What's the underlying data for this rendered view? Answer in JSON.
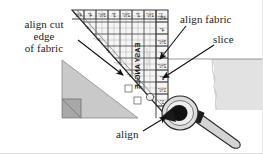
{
  "figure": {
    "background_color": "#ffffff"
  },
  "annotations": [
    {
      "id": "align-cut-edge",
      "text_lines": [
        "align cut",
        "edge",
        "of fabric"
      ],
      "line1": "align cut",
      "line2": "edge",
      "line3": "of fabric",
      "arrow_from": [
        78,
        40
      ],
      "arrow_to": [
        124,
        76
      ]
    },
    {
      "id": "align-fabric",
      "text": "align fabric",
      "arrow_from": [
        186,
        26
      ],
      "arrow_to": [
        159,
        60
      ]
    },
    {
      "id": "slice",
      "text": "slice",
      "arrow_from": [
        214,
        45
      ],
      "arrow_to": [
        162,
        79
      ]
    },
    {
      "id": "align-bottom",
      "text": "align",
      "arrow_from": [
        142,
        131
      ],
      "arrow_to": [
        167,
        116
      ]
    }
  ],
  "ruler": {
    "brand_label": "EASY ANGLE",
    "top_scale": [
      "4½\"",
      "4\"",
      "3½\"",
      "3\"",
      "2½\"",
      "2\"",
      "1½\"",
      "1\""
    ],
    "right_scale": [
      "4½\"",
      "4\"",
      "3½\"",
      "3\"",
      "2½\"",
      "2\"",
      "1½\"",
      "1\""
    ],
    "diagonal_scale": [
      "4\"",
      "3½\"",
      "3\"",
      "2½\"",
      "2\"",
      "1½\""
    ],
    "body_color": "#f2f2f2",
    "line_color": "#4a4a4a"
  },
  "fabric_left": {
    "name": "cut fabric triangle",
    "fill_color": "#c9c9c9",
    "corner_square_color": "#a8a8a8"
  },
  "fabric_right": {
    "name": "fabric strip",
    "fill_color": "#e2e2e2"
  },
  "cutter": {
    "name": "rotary cutter",
    "blade_color": "#1a1a1a",
    "body_color": "#d8d8d8",
    "handle_color": "#d0d0d0"
  }
}
